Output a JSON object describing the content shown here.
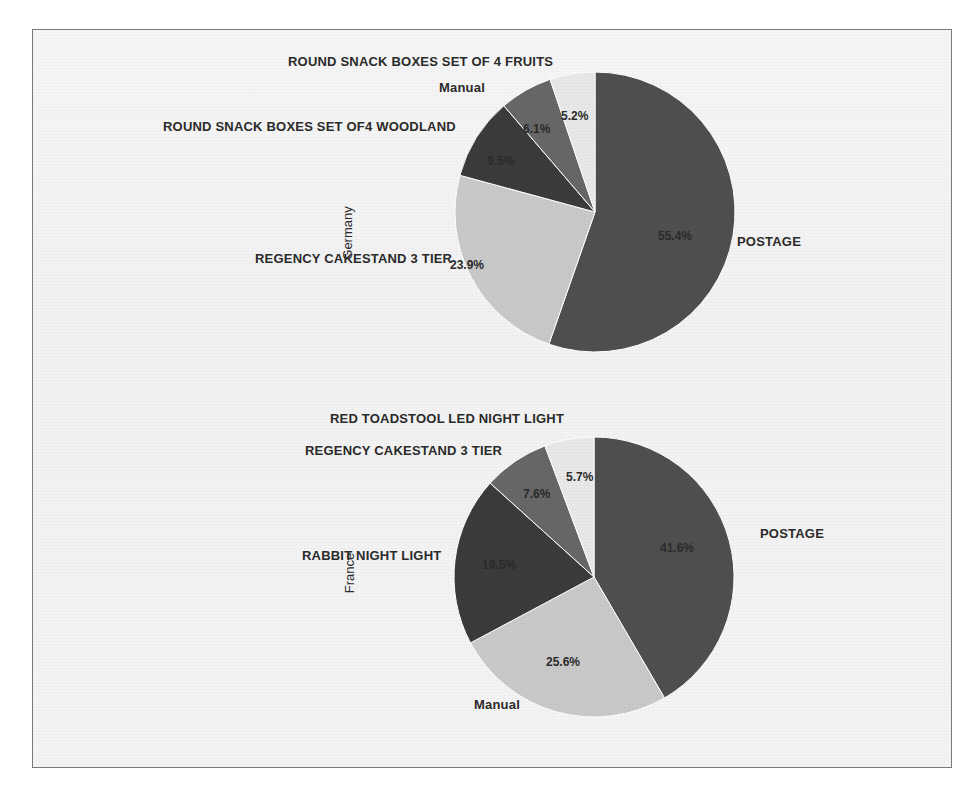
{
  "figure": {
    "background_color": "#f4f4f4",
    "frame_color": "#7b7b7b",
    "page_color": "#ffffff"
  },
  "palette": {
    "postage": "#4f4f4f",
    "manual": "#c9c9c9",
    "third": "#3b3b3b",
    "fourth": "#676767",
    "fifth": "#e8e8e8"
  },
  "chart_data": [
    {
      "type": "pie",
      "title": "",
      "group_label": "Germany",
      "startangle": 90,
      "counterclock": false,
      "autopct": "%.1f%%",
      "categories": [
        "POSTAGE",
        "REGENCY CAKESTAND 3 TIER",
        "ROUND SNACK BOXES SET OF4 WOODLAND",
        "ROUND SNACK BOXES SET OF 4 FRUITS",
        "Manual"
      ],
      "values": [
        55.4,
        23.9,
        9.5,
        6.1,
        5.2
      ],
      "labels_pct": [
        "55.4%",
        "23.9%",
        "9.5%",
        "6.1%",
        "5.2%"
      ],
      "colors": [
        "#4f4f4f",
        "#c9c9c9",
        "#3b3b3b",
        "#676767",
        "#e8e8e8"
      ],
      "legend": "none",
      "grid": false
    },
    {
      "type": "pie",
      "title": "",
      "group_label": "France",
      "startangle": 90,
      "counterclock": false,
      "autopct": "%.1f%%",
      "categories": [
        "POSTAGE",
        "Manual",
        "RABBIT NIGHT LIGHT",
        "REGENCY CAKESTAND 3 TIER",
        "RED TOADSTOOL LED NIGHT LIGHT"
      ],
      "values": [
        41.6,
        25.6,
        19.5,
        7.6,
        5.7
      ],
      "labels_pct": [
        "41.6%",
        "25.6%",
        "19.5%",
        "7.6%",
        "5.7%"
      ],
      "colors": [
        "#4f4f4f",
        "#c9c9c9",
        "#3b3b3b",
        "#676767",
        "#e8e8e8"
      ],
      "legend": "none",
      "grid": false
    }
  ],
  "top_chart": {
    "axis_label": "Germany",
    "slice_labels": {
      "postage": "POSTAGE",
      "cakestand": "REGENCY CAKESTAND 3 TIER",
      "woodland": "ROUND SNACK BOXES SET OF4 WOODLAND",
      "fruits": "ROUND SNACK BOXES SET OF 4 FRUITS",
      "manual": "Manual"
    },
    "pcts": {
      "postage": "55.4%",
      "cakestand": "23.9%",
      "woodland": "9.5%",
      "fruits": "6.1%",
      "manual": "5.2%"
    }
  },
  "bottom_chart": {
    "axis_label": "France",
    "slice_labels": {
      "postage": "POSTAGE",
      "manual": "Manual",
      "rabbit": "RABBIT NIGHT LIGHT",
      "cakestand": "REGENCY CAKESTAND 3 TIER",
      "toadstool": "RED TOADSTOOL LED NIGHT LIGHT"
    },
    "pcts": {
      "postage": "41.6%",
      "manual": "25.6%",
      "rabbit": "19.5%",
      "cakestand": "7.6%",
      "toadstool": "5.7%"
    }
  }
}
